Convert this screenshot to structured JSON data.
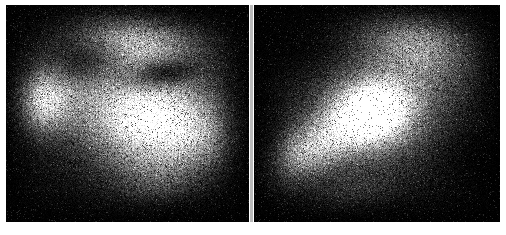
{
  "figure": {
    "title": "",
    "caption": "",
    "kind": "two-panel grayscale intensity map",
    "background_color": "#ffffff",
    "panel_background_color": "#050505",
    "divider_color": "#b9b9b9",
    "divider_label": "panel separator"
  },
  "panels": [
    {
      "id": "left",
      "label": "",
      "x": 6,
      "y": 5,
      "width": 243,
      "height": 217,
      "noise": {
        "seed": 11731,
        "amount": 0.62,
        "speckle": 0.78,
        "scanlines": true
      },
      "peak_intensity": 232,
      "floor_intensity": 4,
      "features": [
        {
          "name": "main-bright-blob",
          "cx": 0.6,
          "cy": 0.53,
          "rx": 0.25,
          "ry": 0.2,
          "rot": -22,
          "peak": 232
        },
        {
          "name": "secondary-bright-blob",
          "cx": 0.15,
          "cy": 0.44,
          "rx": 0.13,
          "ry": 0.15,
          "rot": 10,
          "peak": 176
        },
        {
          "name": "upper-diffuse-plume",
          "cx": 0.55,
          "cy": 0.17,
          "rx": 0.26,
          "ry": 0.15,
          "rot": 18,
          "peak": 140
        },
        {
          "name": "bridge-halo",
          "cx": 0.37,
          "cy": 0.4,
          "rx": 0.26,
          "ry": 0.21,
          "rot": -5,
          "peak": 84
        },
        {
          "name": "outer-halo",
          "cx": 0.5,
          "cy": 0.45,
          "rx": 0.46,
          "ry": 0.42,
          "rot": 0,
          "peak": 46
        },
        {
          "name": "lower-right-tail",
          "cx": 0.78,
          "cy": 0.62,
          "rx": 0.18,
          "ry": 0.16,
          "rot": -35,
          "peak": 96
        },
        {
          "name": "lower-extension",
          "cx": 0.62,
          "cy": 0.78,
          "rx": 0.18,
          "ry": 0.14,
          "rot": -10,
          "peak": 52
        }
      ],
      "dark_lanes": [
        {
          "name": "dust-lane",
          "cx": 0.66,
          "cy": 0.31,
          "rx": 0.16,
          "ry": 0.07,
          "rot": -8,
          "depth": 0.82
        },
        {
          "name": "left-gap",
          "cx": 0.32,
          "cy": 0.26,
          "rx": 0.13,
          "ry": 0.1,
          "rot": 0,
          "depth": 0.55
        }
      ]
    },
    {
      "id": "right",
      "label": "",
      "x": 254,
      "y": 5,
      "width": 246,
      "height": 217,
      "noise": {
        "seed": 28849,
        "amount": 0.62,
        "speckle": 0.78,
        "scanlines": true
      },
      "peak_intensity": 246,
      "floor_intensity": 4,
      "features": [
        {
          "name": "nucleus",
          "cx": 0.48,
          "cy": 0.49,
          "rx": 0.16,
          "ry": 0.14,
          "rot": -25,
          "peak": 246
        },
        {
          "name": "inner-halo",
          "cx": 0.5,
          "cy": 0.49,
          "rx": 0.27,
          "ry": 0.23,
          "rot": -28,
          "peak": 128
        },
        {
          "name": "upper-right-plume",
          "cx": 0.66,
          "cy": 0.18,
          "rx": 0.24,
          "ry": 0.18,
          "rot": 30,
          "peak": 118
        },
        {
          "name": "lower-left-tail",
          "cx": 0.2,
          "cy": 0.68,
          "rx": 0.18,
          "ry": 0.12,
          "rot": -38,
          "peak": 104
        },
        {
          "name": "diagonal-bridge",
          "cx": 0.33,
          "cy": 0.6,
          "rx": 0.22,
          "ry": 0.14,
          "rot": -35,
          "peak": 88
        },
        {
          "name": "outer-halo",
          "cx": 0.52,
          "cy": 0.45,
          "rx": 0.44,
          "ry": 0.42,
          "rot": -20,
          "peak": 42
        },
        {
          "name": "faint-south-wisp",
          "cx": 0.4,
          "cy": 0.86,
          "rx": 0.2,
          "ry": 0.1,
          "rot": -12,
          "peak": 28
        }
      ],
      "dark_lanes": [
        {
          "name": "north-west-gap",
          "cx": 0.18,
          "cy": 0.18,
          "rx": 0.18,
          "ry": 0.16,
          "rot": 0,
          "depth": 0.7
        },
        {
          "name": "east-gap",
          "cx": 0.9,
          "cy": 0.72,
          "rx": 0.16,
          "ry": 0.2,
          "rot": 0,
          "depth": 0.65
        }
      ]
    }
  ]
}
